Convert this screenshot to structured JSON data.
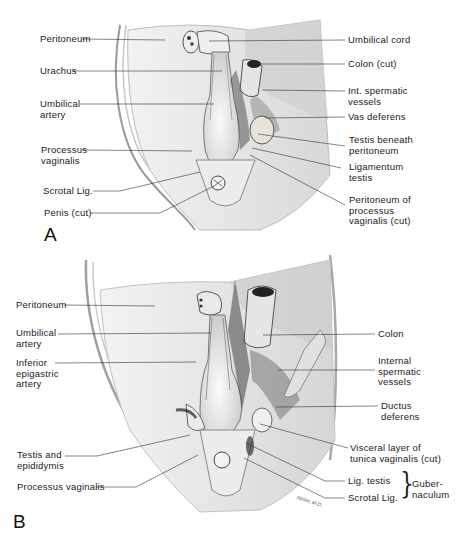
{
  "figure": {
    "panels": [
      {
        "id": "A",
        "letter": "A",
        "labels_left": [
          {
            "text": "Peritoneum"
          },
          {
            "text": "Urachus"
          },
          {
            "text": "Umbilical\nartery"
          },
          {
            "text": "Processus\nvaginalis"
          },
          {
            "text": "Scrotal Lig."
          },
          {
            "text": "Penis (cut)"
          }
        ],
        "labels_right": [
          {
            "text": "Umbilical cord"
          },
          {
            "text": "Colon (cut)"
          },
          {
            "text": "Int. spermatic\nvessels"
          },
          {
            "text": "Vas deferens"
          },
          {
            "text": "Testis beneath\nperitoneum"
          },
          {
            "text": "Ligamentum\ntestis"
          },
          {
            "text": "Peritoneum of\nprocessus\nvaginalis (cut)"
          }
        ]
      },
      {
        "id": "B",
        "letter": "B",
        "labels_left": [
          {
            "text": "Peritoneum"
          },
          {
            "text": "Umbilical\nartery"
          },
          {
            "text": "Inferior\nepigastric\nartery"
          },
          {
            "text": "Testis and\nepididymis"
          },
          {
            "text": "Processus vaginalis"
          }
        ],
        "labels_right": [
          {
            "text": "Colon"
          },
          {
            "text": "Internal\nspermatic\nvessels"
          },
          {
            "text": "Ductus\ndeferens"
          },
          {
            "text": "Visceral layer of\ntunica vaginalis (cut)"
          },
          {
            "text": "Lig. testis"
          },
          {
            "text": "Scrotal Lig."
          }
        ],
        "bracket_label": "Guber-\nnaculum",
        "signature": "Netter, M.D."
      }
    ]
  }
}
